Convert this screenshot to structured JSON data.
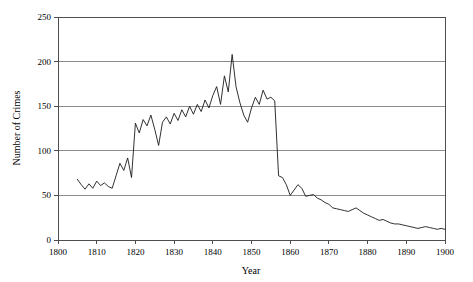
{
  "chart_data": {
    "type": "line",
    "title": "",
    "xlabel": "Year",
    "ylabel": "Number of Crimes",
    "xlim": [
      1800,
      1900
    ],
    "ylim": [
      0,
      250
    ],
    "xticks": [
      1800,
      1810,
      1820,
      1830,
      1840,
      1850,
      1860,
      1870,
      1880,
      1890,
      1900
    ],
    "yticks": [
      0,
      50,
      100,
      150,
      200,
      250
    ],
    "grid": "horizontal",
    "legend": "none",
    "line_color": "#1a1a1a",
    "grid_color": "#8c8c8c",
    "frame_color": "#4d4d4d",
    "x": [
      1805,
      1806,
      1807,
      1808,
      1809,
      1810,
      1811,
      1812,
      1813,
      1814,
      1815,
      1816,
      1817,
      1818,
      1819,
      1820,
      1821,
      1822,
      1823,
      1824,
      1825,
      1826,
      1827,
      1828,
      1829,
      1830,
      1831,
      1832,
      1833,
      1834,
      1835,
      1836,
      1837,
      1838,
      1839,
      1840,
      1841,
      1842,
      1843,
      1844,
      1845,
      1846,
      1847,
      1848,
      1849,
      1850,
      1851,
      1852,
      1853,
      1854,
      1855,
      1856,
      1857,
      1858,
      1859,
      1860,
      1861,
      1862,
      1863,
      1864,
      1865,
      1866,
      1867,
      1868,
      1869,
      1870,
      1871,
      1872,
      1873,
      1874,
      1875,
      1876,
      1877,
      1878,
      1879,
      1880,
      1881,
      1882,
      1883,
      1884,
      1885,
      1886,
      1887,
      1888,
      1889,
      1890,
      1891,
      1892,
      1893,
      1894,
      1895,
      1896,
      1897,
      1898,
      1899,
      1900
    ],
    "values": [
      68,
      62,
      57,
      63,
      58,
      66,
      61,
      64,
      60,
      58,
      72,
      86,
      78,
      92,
      70,
      131,
      120,
      135,
      128,
      140,
      124,
      106,
      132,
      138,
      130,
      142,
      134,
      146,
      138,
      150,
      141,
      152,
      144,
      157,
      148,
      162,
      172,
      152,
      184,
      166,
      208,
      172,
      154,
      140,
      132,
      148,
      160,
      152,
      168,
      158,
      160,
      156,
      72,
      70,
      62,
      50,
      56,
      62,
      58,
      49,
      50,
      51,
      47,
      45,
      42,
      40,
      36,
      35,
      34,
      33,
      32,
      34,
      36,
      33,
      30,
      28,
      26,
      24,
      22,
      23,
      21,
      19,
      18,
      18,
      17,
      16,
      15,
      14,
      13,
      14,
      15,
      14,
      13,
      12,
      13,
      12
    ]
  },
  "axes": {
    "y_tick_labels": [
      "0",
      "50",
      "100",
      "150",
      "200",
      "250"
    ],
    "x_tick_labels": [
      "1800",
      "1810",
      "1820",
      "1830",
      "1840",
      "1850",
      "1860",
      "1870",
      "1880",
      "1890",
      "1900"
    ],
    "x_axis_title": "Year",
    "y_axis_title": "Number of Crimes"
  }
}
